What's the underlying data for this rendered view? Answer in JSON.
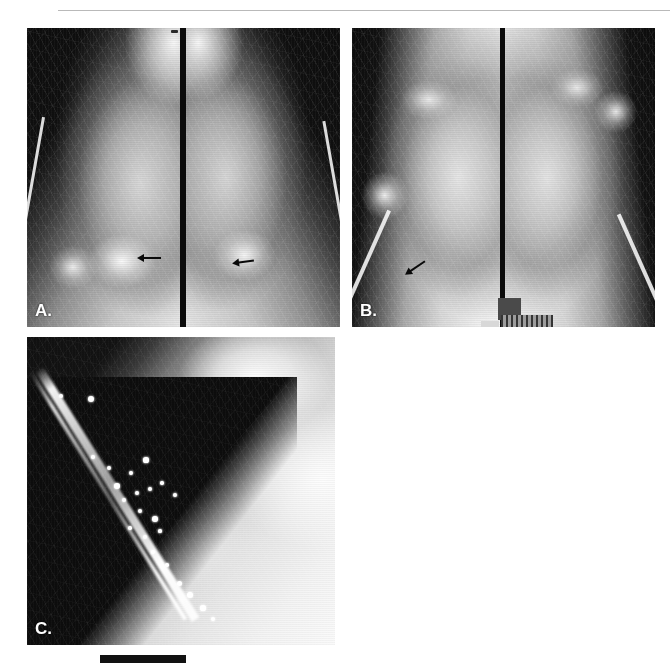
{
  "figure": {
    "type": "radiographic-figure",
    "modality": "mammography",
    "panel_count": 3,
    "background_color": "#ffffff"
  },
  "header": {
    "running_head": "",
    "rule_color": "#b9b9b9"
  },
  "panels": [
    {
      "id": "A",
      "label": "A.",
      "label_color": "#ffffff",
      "description": "Bilateral mediolateral oblique mammographic views shown side by side",
      "view_count": 2,
      "views": [
        {
          "side": "left-image",
          "projection": "MLO"
        },
        {
          "side": "right-image",
          "projection": "MLO"
        }
      ],
      "annotations": [
        {
          "type": "arrow",
          "color": "#0a0a0a",
          "direction": "left",
          "target": "lesion-left-breast"
        },
        {
          "type": "arrow",
          "color": "#0a0a0a",
          "direction": "left",
          "target": "lesion-right-breast"
        }
      ]
    },
    {
      "id": "B",
      "label": "B.",
      "label_color": "#ffffff",
      "description": "Bilateral craniocaudal mammographic views shown side by side",
      "view_count": 2,
      "views": [
        {
          "side": "left-image",
          "projection": "CC"
        },
        {
          "side": "right-image",
          "projection": "CC"
        }
      ],
      "annotations": [
        {
          "type": "arrow",
          "color": "#0a0a0a",
          "direction": "left-down",
          "target": "skin-calcification-region"
        }
      ],
      "markers": [
        {
          "type": "id-block",
          "color": "#4a4a4a"
        },
        {
          "type": "id-block-striped",
          "color": "#7d7d7d"
        },
        {
          "type": "id-block-light",
          "color": "#d8d8d8"
        }
      ]
    },
    {
      "id": "C",
      "label": "C.",
      "label_color": "#ffffff",
      "description": "Magnified detail view demonstrating a cluster of punctate microcalcifications along the skin line",
      "view_count": 1,
      "calcification_count": 23
    }
  ],
  "scalebar": {
    "present": true,
    "color": "#111111",
    "label": ""
  },
  "calcifications": [
    {
      "x": 64,
      "y": 62,
      "r": 3.1
    },
    {
      "x": 34,
      "y": 59,
      "r": 2.4
    },
    {
      "x": 66,
      "y": 120,
      "r": 1.8
    },
    {
      "x": 82,
      "y": 131,
      "r": 2.2
    },
    {
      "x": 90,
      "y": 149,
      "r": 2.8
    },
    {
      "x": 104,
      "y": 136,
      "r": 1.9
    },
    {
      "x": 119,
      "y": 123,
      "r": 2.6
    },
    {
      "x": 97,
      "y": 163,
      "r": 2.1
    },
    {
      "x": 110,
      "y": 156,
      "r": 2.4
    },
    {
      "x": 123,
      "y": 152,
      "r": 2.0
    },
    {
      "x": 135,
      "y": 146,
      "r": 1.7
    },
    {
      "x": 148,
      "y": 158,
      "r": 2.3
    },
    {
      "x": 113,
      "y": 174,
      "r": 2.0
    },
    {
      "x": 128,
      "y": 182,
      "r": 2.7
    },
    {
      "x": 103,
      "y": 191,
      "r": 1.8
    },
    {
      "x": 118,
      "y": 200,
      "r": 2.2
    },
    {
      "x": 133,
      "y": 194,
      "r": 1.6
    },
    {
      "x": 126,
      "y": 215,
      "r": 2.1
    },
    {
      "x": 140,
      "y": 228,
      "r": 1.8
    },
    {
      "x": 152,
      "y": 246,
      "r": 2.5
    },
    {
      "x": 163,
      "y": 258,
      "r": 3.0
    },
    {
      "x": 176,
      "y": 271,
      "r": 2.6
    },
    {
      "x": 186,
      "y": 282,
      "r": 2.2
    }
  ]
}
